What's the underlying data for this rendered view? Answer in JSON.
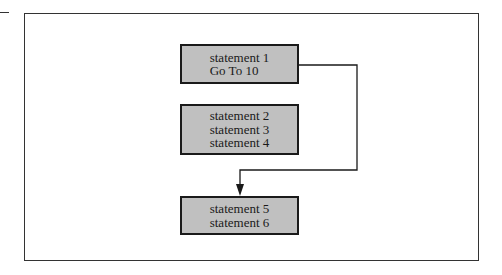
{
  "diagram": {
    "type": "control-flow",
    "blocks": [
      {
        "id": "block-1",
        "lines": [
          "statement 1",
          "Go To 10"
        ]
      },
      {
        "id": "block-2",
        "lines": [
          "statement 2",
          "statement 3",
          "statement 4"
        ]
      },
      {
        "id": "block-3",
        "lines": [
          "statement 5",
          "statement 6"
        ]
      }
    ],
    "edges": [
      {
        "from": "block-1",
        "to": "block-3",
        "label": "",
        "style": "jump-arrow"
      }
    ],
    "colors": {
      "block_fill": "#c0c0c0",
      "block_border": "#1a1a1a",
      "line": "#1a1a1a",
      "background": "#ffffff"
    }
  }
}
